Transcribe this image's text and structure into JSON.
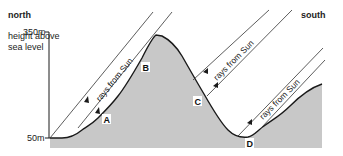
{
  "labels": {
    "north": "north",
    "south": "south",
    "axis_title_line1": "height above",
    "axis_title_line2": "sea level",
    "tick_top": "350m",
    "tick_bottom": "50m"
  },
  "rays": [
    {
      "label": "rays from Sun"
    },
    {
      "label": "rays from Sun"
    },
    {
      "label": "rays from Sun"
    }
  ],
  "points": [
    {
      "label": "A"
    },
    {
      "label": "B"
    },
    {
      "label": "C"
    },
    {
      "label": "D"
    }
  ],
  "colors": {
    "terrain_fill": "#c8c8c8",
    "line": "#1a1a1a"
  }
}
